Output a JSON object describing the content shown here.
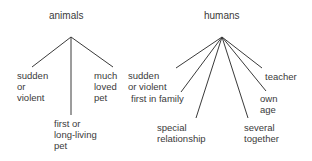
{
  "diagram": {
    "trees": [
      {
        "root": "animals",
        "apex": [
          71,
          37
        ],
        "children": [
          {
            "label": "sudden\nor\nviolent",
            "end": [
              32,
              67
            ],
            "pos": [
              17,
              70
            ]
          },
          {
            "label": "first or\nlong-living\npet",
            "end": [
              71,
              115
            ],
            "pos": [
              54,
              118
            ]
          },
          {
            "label": "much\nloved\npet",
            "end": [
              113,
              67
            ],
            "pos": [
              94,
              70
            ]
          }
        ]
      },
      {
        "root": "humans",
        "apex": [
          222,
          37
        ],
        "children": [
          {
            "label": "sudden\nor violent",
            "end": [
              176,
              68
            ],
            "pos": [
              128,
              70
            ]
          },
          {
            "label": "first in family",
            "end": [
              181,
              92
            ],
            "pos": [
              131,
              93
            ]
          },
          {
            "label": "special\nrelationship",
            "end": [
              196,
              118
            ],
            "pos": [
              157,
              122
            ]
          },
          {
            "label": "several\ntogether",
            "end": [
              248,
              118
            ],
            "pos": [
              244,
              122
            ]
          },
          {
            "label": "own\nage",
            "end": [
              266,
              91
            ],
            "pos": [
              260,
              93
            ]
          },
          {
            "label": "teacher",
            "end": [
              262,
              68
            ],
            "pos": [
              265,
              71
            ]
          }
        ]
      }
    ],
    "labels": {
      "animals_root": "animals",
      "animals_c0": "sudden\nor\nviolent",
      "animals_c1": "first or\nlong-living\npet",
      "animals_c2": "much\nloved\npet",
      "humans_root": "humans",
      "humans_c0": "sudden\nor violent",
      "humans_c1": "first in family",
      "humans_c2": "special\nrelationship",
      "humans_c3": "several\ntogether",
      "humans_c4": "own\nage",
      "humans_c5": "teacher"
    },
    "line_color": "#3a3a3a"
  }
}
